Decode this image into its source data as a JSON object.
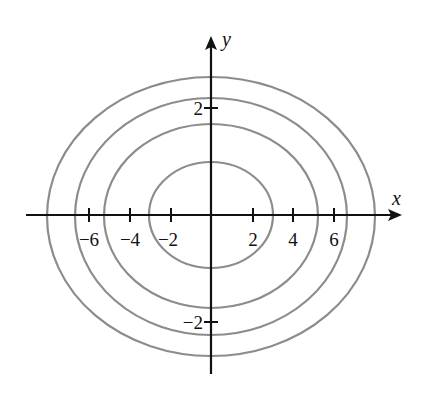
{
  "figure": {
    "type": "contour-ellipses",
    "axes": {
      "x_label": "x",
      "y_label": "y",
      "x_ticks": [
        {
          "value": -6,
          "label": "−6"
        },
        {
          "value": -4,
          "label": "−4"
        },
        {
          "value": -2,
          "label": "−2"
        },
        {
          "value": 2,
          "label": "2"
        },
        {
          "value": 4,
          "label": "4"
        },
        {
          "value": 6,
          "label": "6"
        }
      ],
      "y_ticks": [
        {
          "value": 2,
          "label": "2"
        },
        {
          "value": -2,
          "label": "−2"
        }
      ]
    },
    "ellipses": [
      {
        "level": 1,
        "semi_x": 3.0,
        "semi_y": 1.0
      },
      {
        "level": 2,
        "semi_x": 5.2,
        "semi_y": 1.72
      },
      {
        "level": 3,
        "semi_x": 6.65,
        "semi_y": 2.22
      },
      {
        "level": 4,
        "semi_x": 8.0,
        "semi_y": 2.6
      }
    ],
    "colors": {
      "axes": "#111111",
      "curves": "#8c8c8c"
    }
  }
}
